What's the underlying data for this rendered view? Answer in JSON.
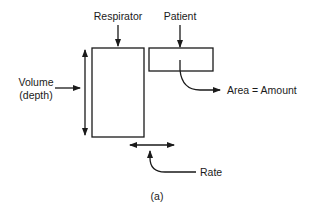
{
  "diagram": {
    "labels": {
      "respirator": "Respirator",
      "patient": "Patient",
      "volume_line1": "Volume",
      "volume_line2": "(depth)",
      "area": "Area = Amount",
      "rate": "Rate",
      "caption": "(a)"
    },
    "colors": {
      "stroke": "#1a1a1a",
      "background": "#ffffff"
    },
    "nodes": [
      {
        "id": "respirator-box",
        "label_key": "respirator"
      },
      {
        "id": "patient-box",
        "label_key": "patient"
      }
    ],
    "annotations": [
      {
        "id": "volume-arrow",
        "label_key": "volume",
        "meaning": "vertical extent of respirator box"
      },
      {
        "id": "area-arrow",
        "label_key": "area",
        "meaning": "area of patient box"
      },
      {
        "id": "rate-arrow",
        "label_key": "rate",
        "meaning": "horizontal gap between boxes"
      }
    ]
  }
}
